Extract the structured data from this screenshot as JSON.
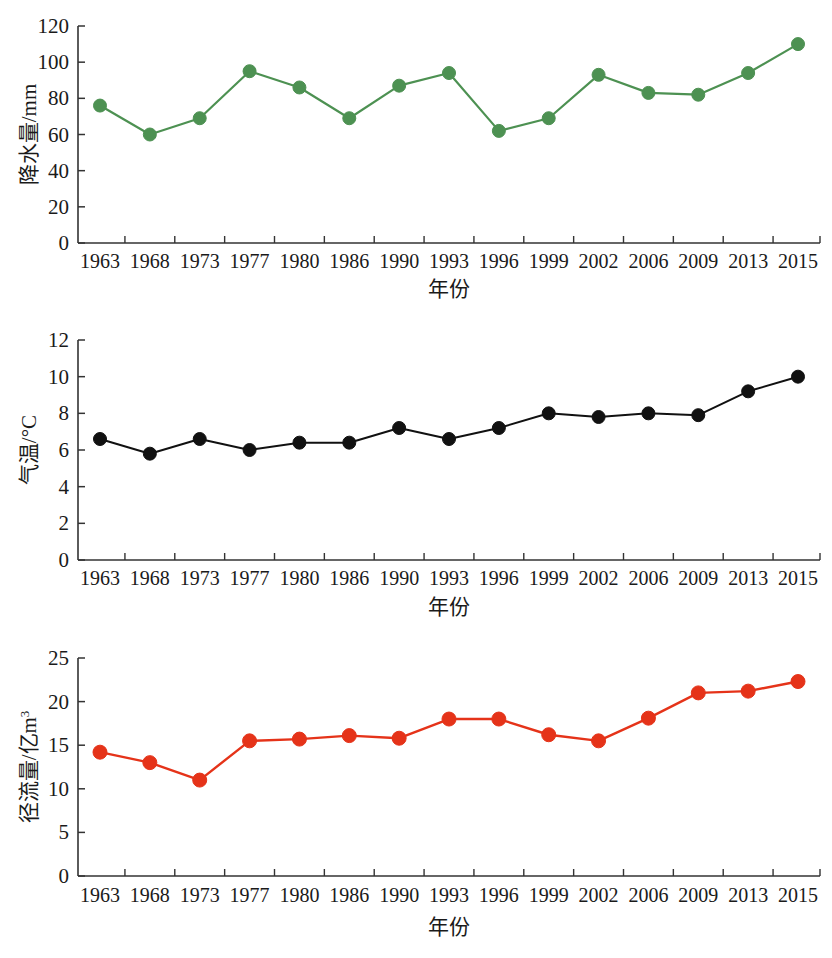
{
  "figure": {
    "background": "#ffffff",
    "panel_count": 3
  },
  "chart_data": [
    {
      "type": "line",
      "title": "",
      "xlabel": "年份",
      "ylabel": "降水量/mm",
      "ylim": [
        0,
        120
      ],
      "yticks": [
        0,
        20,
        40,
        60,
        80,
        100,
        120
      ],
      "grid": false,
      "legend": "none",
      "color": "#4d9152",
      "marker": "circle",
      "categories": [
        "1963",
        "1968",
        "1973",
        "1977",
        "1980",
        "1986",
        "1990",
        "1993",
        "1996",
        "1999",
        "2002",
        "2006",
        "2009",
        "2013",
        "2015"
      ],
      "values": [
        76,
        60,
        69,
        95,
        86,
        69,
        87,
        94,
        62,
        69,
        93,
        83,
        82,
        94,
        110
      ]
    },
    {
      "type": "line",
      "title": "",
      "xlabel": "年份",
      "ylabel": "气温/°C",
      "ylim": [
        0,
        12
      ],
      "yticks": [
        0,
        2,
        4,
        6,
        8,
        10,
        12
      ],
      "grid": false,
      "legend": "none",
      "color": "#111111",
      "marker": "circle",
      "categories": [
        "1963",
        "1968",
        "1973",
        "1977",
        "1980",
        "1986",
        "1990",
        "1993",
        "1996",
        "1999",
        "2002",
        "2006",
        "2009",
        "2013",
        "2015"
      ],
      "values": [
        6.6,
        5.8,
        6.6,
        6.0,
        6.4,
        6.4,
        7.2,
        6.6,
        7.2,
        8.0,
        7.8,
        8.0,
        7.9,
        9.2,
        10.0
      ]
    },
    {
      "type": "line",
      "title": "",
      "xlabel": "年份",
      "ylabel": "径流量/亿m³",
      "ylim": [
        0,
        25
      ],
      "yticks": [
        0,
        5,
        10,
        15,
        20,
        25
      ],
      "grid": false,
      "legend": "none",
      "color": "#e53319",
      "marker": "circle",
      "categories": [
        "1963",
        "1968",
        "1973",
        "1977",
        "1980",
        "1986",
        "1990",
        "1993",
        "1996",
        "1999",
        "2002",
        "2006",
        "2009",
        "2013",
        "2015"
      ],
      "values": [
        14.2,
        13.0,
        11.0,
        15.5,
        15.7,
        16.1,
        15.8,
        18.0,
        18.0,
        16.2,
        15.5,
        18.1,
        21.0,
        21.2,
        22.3
      ]
    }
  ]
}
